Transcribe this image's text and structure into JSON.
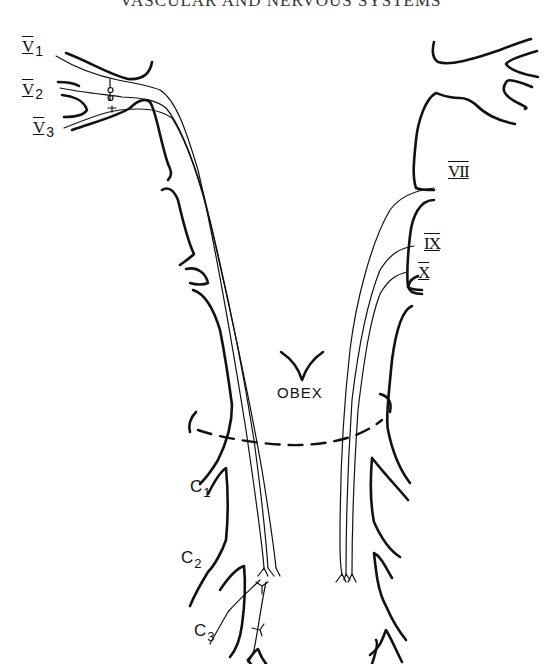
{
  "page": {
    "running_head": "VASCULAR AND NERVOUS SYSTEMS"
  },
  "diagram": {
    "labels": {
      "v1": {
        "numeral": "V",
        "sub": "1"
      },
      "v2": {
        "numeral": "V",
        "sub": "2"
      },
      "v3": {
        "numeral": "V",
        "sub": "3"
      },
      "vii": {
        "numeral": "VII"
      },
      "ix": {
        "numeral": "IX"
      },
      "x": {
        "numeral": "X"
      },
      "obex": "OBEX",
      "c1": {
        "letter": "C",
        "sub": "1"
      },
      "c2": {
        "letter": "C",
        "sub": "2"
      },
      "c3": {
        "letter": "C",
        "sub": "3"
      }
    },
    "line_color": "#111111",
    "background": "#ffffff"
  }
}
